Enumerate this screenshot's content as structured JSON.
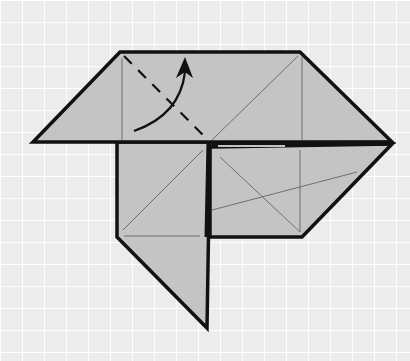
{
  "diagram": {
    "type": "origami-fold-step",
    "instruction": "Valley fold the top-left corner up along the dashed line",
    "colors": {
      "paper": "#c4c4c4",
      "outline": "#111111",
      "crease": "#6e6e6e",
      "background": "#ececec"
    },
    "symbols": {
      "valley_fold_line": "dashed-line",
      "fold_direction": "curved-arrow-up"
    }
  }
}
